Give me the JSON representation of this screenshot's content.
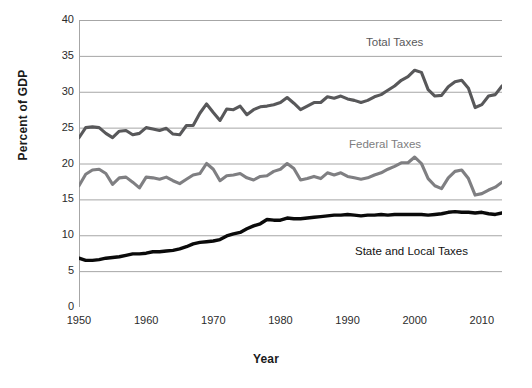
{
  "chart_data": {
    "type": "line",
    "title": "",
    "xlabel": "Year",
    "ylabel": "Percent of GDP",
    "xlim": [
      1950,
      2013
    ],
    "ylim": [
      0,
      40
    ],
    "ytick_labels": [
      "0",
      "5",
      "10",
      "15",
      "20",
      "25",
      "30",
      "35",
      "40"
    ],
    "ytick_values": [
      0,
      5,
      10,
      15,
      20,
      25,
      30,
      35,
      40
    ],
    "xtick_labels": [
      "1950",
      "1960",
      "1970",
      "1980",
      "1990",
      "2000",
      "2010"
    ],
    "xtick_values": [
      1950,
      1960,
      1970,
      1980,
      1990,
      2000,
      2010
    ],
    "grid": "horizontal",
    "legend_position": "inline-annotations",
    "colors": {
      "total": "#58585a",
      "federal": "#7f7f82",
      "state": "#0a0a0a",
      "grid": "#a6a6a6",
      "axis": "#a6a6a6",
      "text": "#1a1a1a"
    },
    "x": [
      1950,
      1951,
      1952,
      1953,
      1954,
      1955,
      1956,
      1957,
      1958,
      1959,
      1960,
      1961,
      1962,
      1963,
      1964,
      1965,
      1966,
      1967,
      1968,
      1969,
      1970,
      1971,
      1972,
      1973,
      1974,
      1975,
      1976,
      1977,
      1978,
      1979,
      1980,
      1981,
      1982,
      1983,
      1984,
      1985,
      1986,
      1987,
      1988,
      1989,
      1990,
      1991,
      1992,
      1993,
      1994,
      1995,
      1996,
      1997,
      1998,
      1999,
      2000,
      2001,
      2002,
      2003,
      2004,
      2005,
      2006,
      2007,
      2008,
      2009,
      2010,
      2011,
      2012,
      2013
    ],
    "series": [
      {
        "name": "Total Taxes",
        "label": "Total Taxes",
        "color": "#58585a",
        "values": [
          23.6,
          25.0,
          25.1,
          25.0,
          24.2,
          23.6,
          24.5,
          24.6,
          24.0,
          24.2,
          25.0,
          24.8,
          24.6,
          24.9,
          24.1,
          24.0,
          25.3,
          25.3,
          27.0,
          28.3,
          27.1,
          26.0,
          27.6,
          27.5,
          28.0,
          26.8,
          27.5,
          27.9,
          28.0,
          28.2,
          28.5,
          29.2,
          28.4,
          27.5,
          28.0,
          28.5,
          28.5,
          29.3,
          29.1,
          29.4,
          29.0,
          28.8,
          28.5,
          28.8,
          29.3,
          29.6,
          30.2,
          30.8,
          31.6,
          32.1,
          33.0,
          32.7,
          30.3,
          29.4,
          29.5,
          30.7,
          31.4,
          31.6,
          30.5,
          27.8,
          28.2,
          29.4,
          29.6,
          30.8
        ]
      },
      {
        "name": "Federal Taxes",
        "label": "Federal Taxes",
        "color": "#7f7f82",
        "values": [
          16.9,
          18.5,
          19.1,
          19.2,
          18.6,
          17.1,
          18.0,
          18.1,
          17.4,
          16.6,
          18.1,
          18.0,
          17.8,
          18.1,
          17.6,
          17.2,
          17.8,
          18.4,
          18.6,
          20.0,
          19.2,
          17.6,
          18.3,
          18.4,
          18.6,
          18.0,
          17.7,
          18.2,
          18.3,
          18.9,
          19.2,
          20.0,
          19.3,
          17.7,
          17.9,
          18.2,
          17.9,
          18.7,
          18.4,
          18.7,
          18.2,
          18.0,
          17.8,
          18.0,
          18.4,
          18.7,
          19.2,
          19.6,
          20.1,
          20.1,
          20.9,
          20.0,
          17.9,
          16.9,
          16.5,
          18.0,
          18.9,
          19.1,
          17.9,
          15.6,
          15.8,
          16.3,
          16.7,
          17.4
        ]
      },
      {
        "name": "State and Local Taxes",
        "label": "State and Local Taxes",
        "color": "#0a0a0a",
        "values": [
          6.8,
          6.5,
          6.5,
          6.6,
          6.8,
          6.9,
          7.0,
          7.2,
          7.4,
          7.4,
          7.5,
          7.7,
          7.7,
          7.8,
          7.9,
          8.1,
          8.4,
          8.8,
          9.0,
          9.1,
          9.2,
          9.4,
          9.9,
          10.2,
          10.4,
          10.9,
          11.3,
          11.6,
          12.2,
          12.1,
          12.1,
          12.4,
          12.3,
          12.3,
          12.4,
          12.5,
          12.6,
          12.7,
          12.8,
          12.8,
          12.9,
          12.8,
          12.7,
          12.8,
          12.8,
          12.9,
          12.8,
          12.9,
          12.9,
          12.9,
          12.9,
          12.9,
          12.8,
          12.9,
          13.0,
          13.2,
          13.3,
          13.2,
          13.2,
          13.1,
          13.2,
          13.0,
          12.9,
          13.1
        ]
      }
    ],
    "annotations": [
      {
        "name": "total-taxes-label",
        "text": "Total Taxes",
        "x_px": 366,
        "y_px": 36
      },
      {
        "name": "federal-taxes-label",
        "text": "Federal Taxes",
        "x_px": 349,
        "y_px": 138
      },
      {
        "name": "state-and-local-taxes-label",
        "text": "State and Local Taxes",
        "x_px": 355,
        "y_px": 245
      }
    ]
  }
}
